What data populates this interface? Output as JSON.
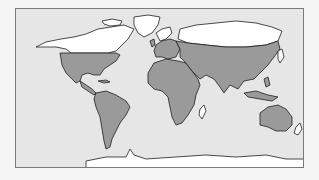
{
  "map": {
    "type": "world map",
    "projection": "equirectangular-like",
    "colors": {
      "ocean": "#e6e6e6",
      "shaded_region": "#9a9a9a",
      "unshaded_land": "#ffffff",
      "coastline": "#1e1e1e",
      "frame": "#7a7a7a",
      "page_background": "#f5f5f5"
    },
    "regions": [
      {
        "name": "North America (northern, Canada/Alaska)",
        "shading": "unshaded"
      },
      {
        "name": "Greenland",
        "shading": "unshaded"
      },
      {
        "name": "United States and Mexico",
        "shading": "shaded"
      },
      {
        "name": "Central America and Caribbean",
        "shading": "shaded"
      },
      {
        "name": "South America",
        "shading": "shaded"
      },
      {
        "name": "Europe (southern/western)",
        "shading": "shaded"
      },
      {
        "name": "Scandinavia",
        "shading": "unshaded"
      },
      {
        "name": "Africa",
        "shading": "shaded"
      },
      {
        "name": "Madagascar",
        "shading": "unshaded"
      },
      {
        "name": "Asia (central/southern)",
        "shading": "shaded"
      },
      {
        "name": "Siberia / northern Russia",
        "shading": "unshaded"
      },
      {
        "name": "Southeast Asia / Indonesia",
        "shading": "shaded"
      },
      {
        "name": "Australia",
        "shading": "shaded"
      },
      {
        "name": "New Zealand",
        "shading": "unshaded"
      },
      {
        "name": "Antarctica",
        "shading": "unshaded"
      }
    ]
  }
}
